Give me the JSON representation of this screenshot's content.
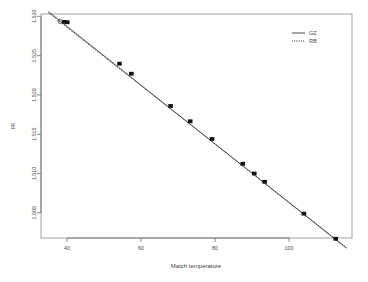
{
  "chart_data": {
    "type": "scatter",
    "title": "",
    "xlabel": "Match temperature",
    "ylabel": "RI",
    "xlim": [
      33,
      117
    ],
    "ylim": [
      1.5018,
      1.5303
    ],
    "xticks": [
      40,
      60,
      80,
      100
    ],
    "xticklabels": [
      "40",
      "60",
      "80",
      "100"
    ],
    "yticks": [
      1.53,
      1.525,
      1.52,
      1.515,
      1.51,
      1.505
    ],
    "yticklabels": [
      "1.530",
      "1.525",
      "1.520",
      "1.515",
      "1.510",
      "1.505"
    ],
    "grid": false,
    "legend_position": "top-right",
    "points": [
      {
        "x": 38.2,
        "y": 1.52935,
        "marker": "open-circle"
      },
      {
        "x": 39.3,
        "y": 1.5293,
        "marker": "filled-square"
      },
      {
        "x": 40.1,
        "y": 1.52925,
        "marker": "filled-square"
      },
      {
        "x": 54.2,
        "y": 1.52398,
        "marker": "filled-square"
      },
      {
        "x": 57.4,
        "y": 1.5227,
        "marker": "filled-square"
      },
      {
        "x": 68.0,
        "y": 1.5186,
        "marker": "filled-square"
      },
      {
        "x": 73.3,
        "y": 1.51665,
        "marker": "filled-square"
      },
      {
        "x": 79.2,
        "y": 1.5144,
        "marker": "filled-square"
      },
      {
        "x": 87.5,
        "y": 1.51125,
        "marker": "filled-square"
      },
      {
        "x": 90.6,
        "y": 1.51,
        "marker": "filled-square"
      },
      {
        "x": 93.4,
        "y": 1.50895,
        "marker": "filled-square"
      },
      {
        "x": 104.0,
        "y": 1.5049,
        "marker": "filled-square"
      },
      {
        "x": 112.6,
        "y": 1.5017,
        "marker": "filled-square"
      }
    ],
    "series": [
      {
        "name": "GZ",
        "style": "solid",
        "line": {
          "x0": 35.0,
          "y0": 1.5306,
          "x1": 115.5,
          "y1": 1.5005
        }
      },
      {
        "name": "RB",
        "style": "dotted",
        "line": {
          "x0": 35.0,
          "y0": 1.53045,
          "x1": 115.5,
          "y1": 1.5006
        }
      }
    ],
    "legend": [
      {
        "label": "GZ",
        "style": "solid"
      },
      {
        "label": "RB",
        "style": "dotted"
      }
    ]
  }
}
